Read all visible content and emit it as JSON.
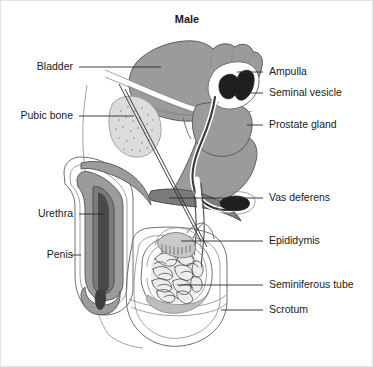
{
  "figure": {
    "title": "Male",
    "view": "sagittal cross-section",
    "background_color": "#ffffff",
    "border_color": "#e3e3e3",
    "line_color": "#2b2b2b",
    "palette": {
      "organ_mid_gray": "#9b9b9b",
      "organ_dark_gray": "#7b7b7b",
      "organ_light_gray": "#c9c9c9",
      "organ_pale_gray": "#dcdcdc",
      "organ_black": "#1f1f1f",
      "outline_gray": "#6f6f6f",
      "text": "#1a1a1a"
    }
  },
  "labels_left": [
    {
      "id": "bladder",
      "text": "Bladder",
      "x": 72,
      "y": 69
    },
    {
      "id": "pubic-bone",
      "text": "Pubic bone",
      "x": 72,
      "y": 118
    },
    {
      "id": "urethra",
      "text": "Urethra",
      "x": 72,
      "y": 216
    },
    {
      "id": "penis",
      "text": "Penis",
      "x": 72,
      "y": 257
    }
  ],
  "labels_right": [
    {
      "id": "ampulla",
      "text": "Ampulla",
      "x": 268,
      "y": 74
    },
    {
      "id": "seminal-vesicle",
      "text": "Seminal vesicle",
      "x": 268,
      "y": 95
    },
    {
      "id": "prostate-gland",
      "text": "Prostate gland",
      "x": 268,
      "y": 127
    },
    {
      "id": "vas-deferens",
      "text": "Vas deferens",
      "x": 268,
      "y": 200
    },
    {
      "id": "epididymis",
      "text": "Epididymis",
      "x": 268,
      "y": 243
    },
    {
      "id": "seminiferous-tube",
      "text": "Seminiferous tube",
      "x": 268,
      "y": 287
    },
    {
      "id": "scrotum",
      "text": "Scrotum",
      "x": 268,
      "y": 312
    }
  ],
  "structures": [
    {
      "id": "bladder",
      "name": "Bladder",
      "shade": "organ_mid_gray"
    },
    {
      "id": "pubic-bone",
      "name": "Pubic bone",
      "shade": "organ_pale_gray"
    },
    {
      "id": "prostate-gland",
      "name": "Prostate gland",
      "shade": "organ_mid_gray"
    },
    {
      "id": "seminal-vesicle",
      "name": "Seminal vesicle",
      "shade": "organ_black"
    },
    {
      "id": "ampulla",
      "name": "Ampulla",
      "shade": "organ_black"
    },
    {
      "id": "vas-deferens",
      "name": "Vas deferens",
      "shade": "organ_black"
    },
    {
      "id": "epididymis",
      "name": "Epididymis",
      "shade": "organ_light_gray"
    },
    {
      "id": "testis",
      "name": "Testis with seminiferous tubules",
      "shade": "organ_light_gray"
    },
    {
      "id": "scrotum",
      "name": "Scrotum",
      "shade": "outline"
    },
    {
      "id": "penis",
      "name": "Penis",
      "shade": "organ_mid_gray"
    },
    {
      "id": "urethra",
      "name": "Urethra",
      "shade": "organ_dark_gray"
    },
    {
      "id": "rectum",
      "name": "Rectum",
      "shade": "organ_mid_gray"
    }
  ]
}
